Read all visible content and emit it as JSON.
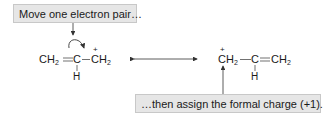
{
  "callouts": {
    "top": "Move one electron pair…",
    "bottom": "…then assign the formal charge (+1)."
  },
  "left_structure": {
    "atoms": [
      "CH",
      "C",
      "CH"
    ],
    "subscripts": [
      "2",
      "2"
    ],
    "bonds": [
      "double",
      "single"
    ],
    "substituent": "H",
    "charge": "+",
    "charge_atom": "terminal CH2 (right)"
  },
  "right_structure": {
    "atoms": [
      "CH",
      "C",
      "CH"
    ],
    "subscripts": [
      "2",
      "2"
    ],
    "bonds": [
      "single",
      "double"
    ],
    "substituent": "H",
    "charge": "+",
    "charge_atom": "terminal CH2 (left)"
  },
  "resonance_arrow": "double-headed",
  "colors": {
    "callout_bg": "#e6e6e6",
    "callout_border": "#c8c8c8",
    "text": "#1a1a1a",
    "arrow": "#333333"
  }
}
